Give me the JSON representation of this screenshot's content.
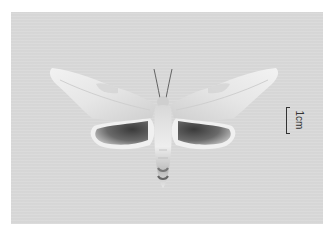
{
  "image": {
    "subject": "moth specimen (hawk moth), dorsal view, wings spread",
    "background_color": "#d9d9d9",
    "border_color": "#ffffff"
  },
  "scale_bar": {
    "label": "1cm"
  }
}
